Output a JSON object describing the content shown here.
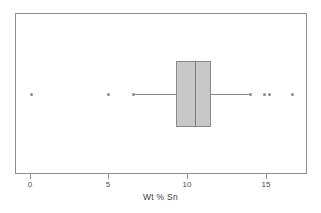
{
  "chart_data": {
    "type": "box",
    "title": "",
    "xlabel": "Wt % Sn",
    "ylabel": "",
    "orientation": "horizontal",
    "xlim": [
      -0.95,
      17.55
    ],
    "grid": false,
    "legend": null,
    "xticks": [
      {
        "value": 0,
        "label": "0",
        "px": 30
      },
      {
        "value": 5,
        "label": "5",
        "px": 108
      },
      {
        "value": 10,
        "label": "10",
        "px": 187
      },
      {
        "value": 15,
        "label": "15",
        "px": 266
      }
    ],
    "box": {
      "q1": 9.3,
      "median": 10.5,
      "q3": 11.5,
      "whisker_low": 6.6,
      "whisker_high": 14.0,
      "fill_color": "#c8c8c8",
      "edge_color": "#8b8b8b"
    },
    "outliers": [
      0.1,
      5.0,
      6.6,
      14.0,
      14.9,
      15.2,
      16.7
    ],
    "outlier_color": "#8a8a8a"
  },
  "axis": {
    "label": "Wt % Sn",
    "tick_labels": [
      "0",
      "5",
      "10",
      "15"
    ]
  },
  "colors": {
    "frame": "#8d8d8d",
    "box_fill": "#c8c8c8",
    "box_edge": "#8b8b8b",
    "whisker": "#8b8b8b",
    "outlier": "#8a8a8a",
    "background": "#ffffff",
    "text": "#3c3c3c"
  }
}
